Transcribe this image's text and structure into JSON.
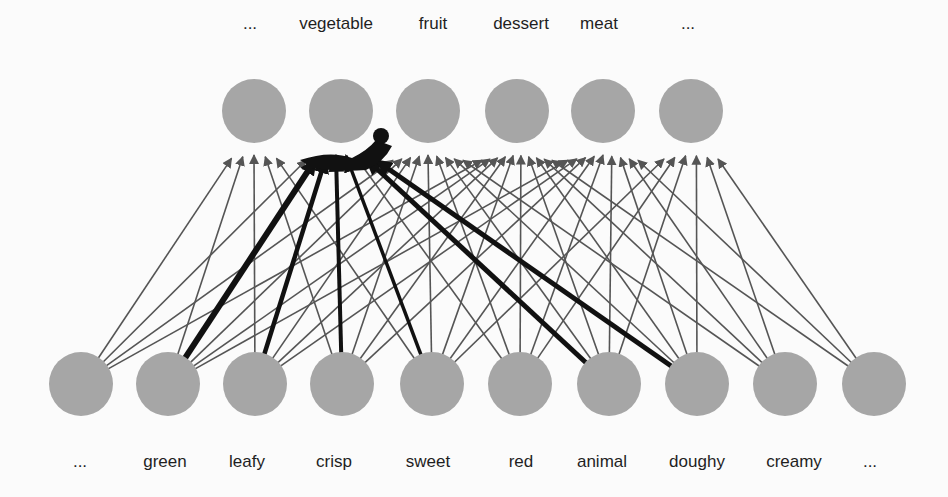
{
  "colors": {
    "background": "#fbfbfb",
    "node": "#a6a6a6",
    "thin_edge": "#555555",
    "thick_edge": "#111111",
    "label": "#1f1f1f"
  },
  "top_nodes": [
    {
      "label": "...",
      "x": 254,
      "y": 111
    },
    {
      "label": "vegetable",
      "x": 341,
      "y": 111
    },
    {
      "label": "fruit",
      "x": 428,
      "y": 111
    },
    {
      "label": "dessert",
      "x": 517,
      "y": 111
    },
    {
      "label": "meat",
      "x": 603,
      "y": 111
    },
    {
      "label": "...",
      "x": 691,
      "y": 111
    }
  ],
  "top_label_positions": [
    250,
    336,
    433,
    521,
    599,
    688
  ],
  "bottom_nodes": [
    {
      "label": "...",
      "x": 81,
      "y": 384
    },
    {
      "label": "green",
      "x": 168,
      "y": 384
    },
    {
      "label": "leafy",
      "x": 255,
      "y": 384
    },
    {
      "label": "crisp",
      "x": 342,
      "y": 384
    },
    {
      "label": "sweet",
      "x": 432,
      "y": 384
    },
    {
      "label": "red",
      "x": 520,
      "y": 384
    },
    {
      "label": "animal",
      "x": 609,
      "y": 384
    },
    {
      "label": "doughy",
      "x": 697,
      "y": 384
    },
    {
      "label": "creamy",
      "x": 785,
      "y": 384
    },
    {
      "label": "...",
      "x": 874,
      "y": 384
    }
  ],
  "bottom_label_positions": [
    80,
    165,
    247,
    334,
    428,
    521,
    602,
    697,
    794,
    870
  ],
  "node_radius": 32,
  "edges": [
    {
      "from": 0,
      "to": 0
    },
    {
      "from": 0,
      "to": 1
    },
    {
      "from": 0,
      "to": 2
    },
    {
      "from": 0,
      "to": 3
    },
    {
      "from": 1,
      "to": 0
    },
    {
      "from": 1,
      "to": 1,
      "weight": 6
    },
    {
      "from": 1,
      "to": 2
    },
    {
      "from": 1,
      "to": 3
    },
    {
      "from": 1,
      "to": 4
    },
    {
      "from": 2,
      "to": 0
    },
    {
      "from": 2,
      "to": 1,
      "weight": 4.5
    },
    {
      "from": 2,
      "to": 2
    },
    {
      "from": 2,
      "to": 3
    },
    {
      "from": 2,
      "to": 4
    },
    {
      "from": 3,
      "to": 0
    },
    {
      "from": 3,
      "to": 1,
      "weight": 4
    },
    {
      "from": 3,
      "to": 2
    },
    {
      "from": 3,
      "to": 3
    },
    {
      "from": 3,
      "to": 4
    },
    {
      "from": 4,
      "to": 0
    },
    {
      "from": 4,
      "to": 1,
      "weight": 3.5
    },
    {
      "from": 4,
      "to": 2
    },
    {
      "from": 4,
      "to": 3
    },
    {
      "from": 4,
      "to": 4
    },
    {
      "from": 4,
      "to": 5
    },
    {
      "from": 5,
      "to": 1
    },
    {
      "from": 5,
      "to": 2
    },
    {
      "from": 5,
      "to": 3
    },
    {
      "from": 5,
      "to": 4
    },
    {
      "from": 5,
      "to": 5
    },
    {
      "from": 6,
      "to": 1,
      "weight": 5
    },
    {
      "from": 6,
      "to": 2
    },
    {
      "from": 6,
      "to": 3
    },
    {
      "from": 6,
      "to": 4
    },
    {
      "from": 6,
      "to": 5
    },
    {
      "from": 7,
      "to": 1,
      "weight": 5
    },
    {
      "from": 7,
      "to": 2
    },
    {
      "from": 7,
      "to": 3
    },
    {
      "from": 7,
      "to": 4
    },
    {
      "from": 7,
      "to": 5
    },
    {
      "from": 8,
      "to": 2
    },
    {
      "from": 8,
      "to": 3
    },
    {
      "from": 8,
      "to": 4
    },
    {
      "from": 8,
      "to": 5
    },
    {
      "from": 9,
      "to": 3
    },
    {
      "from": 9,
      "to": 4
    },
    {
      "from": 9,
      "to": 5
    }
  ],
  "focus_dot": {
    "x": 381,
    "y": 136,
    "r": 8
  }
}
